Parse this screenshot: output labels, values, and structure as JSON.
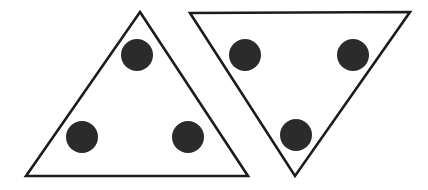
{
  "figure": {
    "width": 428,
    "height": 190,
    "background_color": "#ffffff",
    "stroke_color": "#1c1c1c",
    "dot_color": "#2b2b2b",
    "stroke_width": 2.6,
    "shapes": [
      {
        "name": "left-triangle",
        "orientation": "point-up",
        "points": "140,12 248,176 26,176",
        "dots": [
          {
            "name": "left-triangle-dot-top",
            "cx": 137,
            "cy": 55,
            "r": 16
          },
          {
            "name": "left-triangle-dot-bottom-left",
            "cx": 82,
            "cy": 137,
            "r": 16
          },
          {
            "name": "left-triangle-dot-bottom-right",
            "cx": 188,
            "cy": 137,
            "r": 16
          }
        ]
      },
      {
        "name": "right-triangle",
        "orientation": "point-down",
        "points": "190,13 410,12 295,176",
        "dots": [
          {
            "name": "right-triangle-dot-top-left",
            "cx": 245,
            "cy": 55,
            "r": 16
          },
          {
            "name": "right-triangle-dot-top-right",
            "cx": 353,
            "cy": 55,
            "r": 16
          },
          {
            "name": "right-triangle-dot-bottom",
            "cx": 296,
            "cy": 135,
            "r": 16
          }
        ]
      }
    ]
  }
}
